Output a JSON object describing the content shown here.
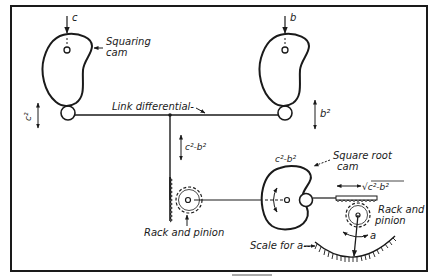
{
  "diagram": {
    "labels": {
      "input_c": "c",
      "input_b": "b",
      "squaring_cam_line1": "Squaring",
      "squaring_cam_line2": "cam",
      "link_differential": "Link differential-",
      "c_squared": "c²",
      "b_squared": "b²",
      "diff_vertical": "c²-b²",
      "rack_pinion_left": "Rack and pinion",
      "sqrt_cam_top": "c²-b²",
      "square_root_cam_line1": "Square root",
      "square_root_cam_line2": "cam",
      "sqrt_output": "√c²-b²",
      "rack_pinion_right_line1": "Rack and",
      "rack_pinion_right_line2": "pinion",
      "output_a": "a",
      "scale_for_a": "Scale for a--"
    },
    "components": [
      {
        "name": "Squaring cam (c)",
        "input": "c",
        "output": "c²"
      },
      {
        "name": "Squaring cam (b)",
        "input": "b",
        "output": "b²"
      },
      {
        "name": "Link differential",
        "inputs": [
          "c²",
          "b²"
        ],
        "output": "c²-b²"
      },
      {
        "name": "Rack and pinion",
        "input": "c²-b²"
      },
      {
        "name": "Square root cam",
        "input": "c²-b²",
        "output": "√(c²-b²)"
      },
      {
        "name": "Rack and pinion",
        "input": "√(c²-b²)",
        "output": "a"
      },
      {
        "name": "Scale for a",
        "reads": "a"
      }
    ],
    "colors": {
      "ink": "#1a1a1a",
      "background": "#ffffff"
    }
  }
}
